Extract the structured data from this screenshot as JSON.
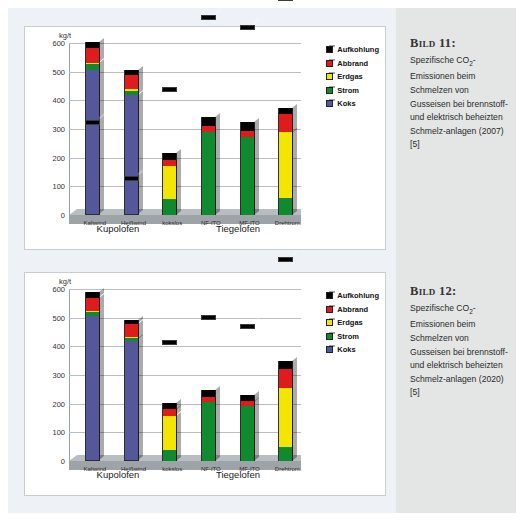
{
  "page": {
    "background": "#ffffff",
    "panel_bg": "#eef2f6",
    "caption_band_bg": "#e4e6e6"
  },
  "legend": {
    "items": [
      {
        "label": "Aufkohlung",
        "color": "#000000",
        "key": "aufkohlung"
      },
      {
        "label": "Abbrand",
        "color": "#e01b1b",
        "key": "abbrand"
      },
      {
        "label": "Erdgas",
        "color": "#f2e500",
        "key": "erdgas"
      },
      {
        "label": "Strom",
        "color": "#108a2e",
        "key": "strom"
      },
      {
        "label": "Koks",
        "color": "#54589b",
        "key": "koks"
      }
    ]
  },
  "axis": {
    "unit": "kg/t",
    "ticks": [
      "600",
      "500",
      "400",
      "300",
      "200",
      "100",
      "0"
    ],
    "ymax": 600,
    "ymin": 0
  },
  "groups": [
    {
      "label": "Kupolofen",
      "span": [
        0,
        2
      ]
    },
    {
      "label": "Tiegelofen",
      "span": [
        3,
        5
      ]
    }
  ],
  "captions": [
    {
      "title": "Bild 11:",
      "line1": "Spezifische CO",
      "sub1": "2",
      "line1b": "-",
      "rest": "Emissionen beim Schmelzen von Gusseisen bei brennstoff- und elektrisch beheizten Schmelz-anlagen (2007) [5]"
    },
    {
      "title": "Bild 12:",
      "line1": "Spezifische CO",
      "sub1": "2",
      "line1b": "-",
      "rest": "Emissionen beim Schmelzen von Gusseisen bei brennstoff- und elektrisch beheizten Schmelz-anlagen (2020) [5]"
    }
  ],
  "chart_data": [
    {
      "type": "bar",
      "title": "Bild 11",
      "stacked": true,
      "ylabel": "kg/t",
      "ylim": [
        0,
        600
      ],
      "yticks": [
        0,
        100,
        200,
        300,
        400,
        500,
        600
      ],
      "grid": true,
      "legend_position": "right",
      "categories": [
        "Kaltwind",
        "Heißwind",
        "kokslos",
        "NF-ITO",
        "MF-ITO",
        "Drehtrom."
      ],
      "group_labels": [
        "Kupolofen",
        "Kupolofen",
        "Kupolofen",
        "Tiegelofen",
        "Tiegelofen",
        "Tiegelofen"
      ],
      "series": [
        {
          "name": "Koks",
          "color": "#54589b",
          "values": [
            505,
            420,
            0,
            0,
            0,
            0
          ]
        },
        {
          "name": "Strom",
          "color": "#108a2e",
          "values": [
            22,
            12,
            55,
            290,
            272,
            58
          ]
        },
        {
          "name": "Erdgas",
          "color": "#f2e500",
          "values": [
            5,
            8,
            115,
            0,
            0,
            230
          ]
        },
        {
          "name": "Abbrand",
          "color": "#e01b1b",
          "values": [
            50,
            48,
            22,
            22,
            22,
            65
          ]
        },
        {
          "name": "Aufkohlung",
          "color": "#000000",
          "values": [
            20,
            17,
            25,
            30,
            30,
            22
          ]
        }
      ],
      "totals": [
        602,
        505,
        217,
        342,
        324,
        375
      ]
    },
    {
      "type": "bar",
      "title": "Bild 12",
      "stacked": true,
      "ylabel": "kg/t",
      "ylim": [
        0,
        600
      ],
      "yticks": [
        0,
        100,
        200,
        300,
        400,
        500,
        600
      ],
      "grid": true,
      "legend_position": "right",
      "categories": [
        "Kaltwind",
        "Heißwind",
        "kokslos",
        "NF-ITO",
        "MF-ITO",
        "Drehtrom."
      ],
      "group_labels": [
        "Kupolofen",
        "Kupolofen",
        "Kupolofen",
        "Tiegelofen",
        "Tiegelofen",
        "Tiegelofen"
      ],
      "series": [
        {
          "name": "Koks",
          "color": "#54589b",
          "values": [
            505,
            418,
            0,
            0,
            0,
            0
          ]
        },
        {
          "name": "Strom",
          "color": "#108a2e",
          "values": [
            15,
            10,
            40,
            205,
            192,
            48
          ]
        },
        {
          "name": "Erdgas",
          "color": "#f2e500",
          "values": [
            5,
            6,
            118,
            0,
            0,
            205
          ]
        },
        {
          "name": "Abbrand",
          "color": "#e01b1b",
          "values": [
            45,
            45,
            22,
            18,
            16,
            68
          ]
        },
        {
          "name": "Aufkohlung",
          "color": "#000000",
          "values": [
            18,
            12,
            24,
            24,
            24,
            28
          ]
        }
      ],
      "totals": [
        588,
        491,
        204,
        247,
        232,
        349
      ]
    }
  ]
}
